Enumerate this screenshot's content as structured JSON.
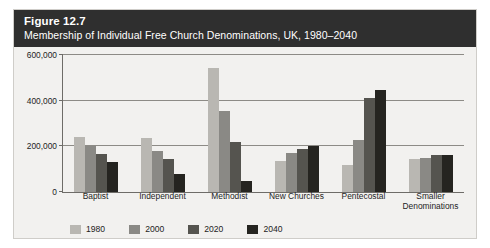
{
  "figure": {
    "number": "Figure 12.7",
    "caption": "Membership of Individual Free Church Denominations, UK, 1980–2040"
  },
  "chart_data": {
    "type": "bar",
    "title": "Membership of Individual Free Church Denominations, UK, 1980–2040",
    "xlabel": "",
    "ylabel": "",
    "ylim": [
      0,
      600000
    ],
    "yticks": [
      0,
      200000,
      400000,
      600000
    ],
    "ytick_labels": [
      "0",
      "200,000",
      "400,000",
      "600,000"
    ],
    "grid": true,
    "legend_position": "bottom-left",
    "categories": [
      "Baptist",
      "Independent",
      "Methodist",
      "New Churches",
      "Pentecostal",
      "Smaller Denominations"
    ],
    "category_lines": [
      [
        "Baptist"
      ],
      [
        "Independent"
      ],
      [
        "Methodist"
      ],
      [
        "New Churches"
      ],
      [
        "Pentecostal"
      ],
      [
        "Smaller",
        "Denominations"
      ]
    ],
    "series": [
      {
        "name": "1980",
        "color": "#b9b7b2",
        "values": [
          240000,
          237000,
          545000,
          137000,
          117000,
          145000
        ]
      },
      {
        "name": "2000",
        "color": "#8a8985",
        "values": [
          200000,
          180000,
          355000,
          170000,
          228000,
          148000
        ]
      },
      {
        "name": "2020",
        "color": "#55544f",
        "values": [
          165000,
          145000,
          220000,
          190000,
          410000,
          163000
        ]
      },
      {
        "name": "2040",
        "color": "#252420",
        "values": [
          130000,
          80000,
          50000,
          200000,
          445000,
          160000
        ]
      }
    ]
  },
  "colors": {
    "header_bg": "#2f2f2f",
    "panel_bg": "#f2f1ef",
    "axis": "#6e6c68",
    "grid": "#8d8b86"
  }
}
